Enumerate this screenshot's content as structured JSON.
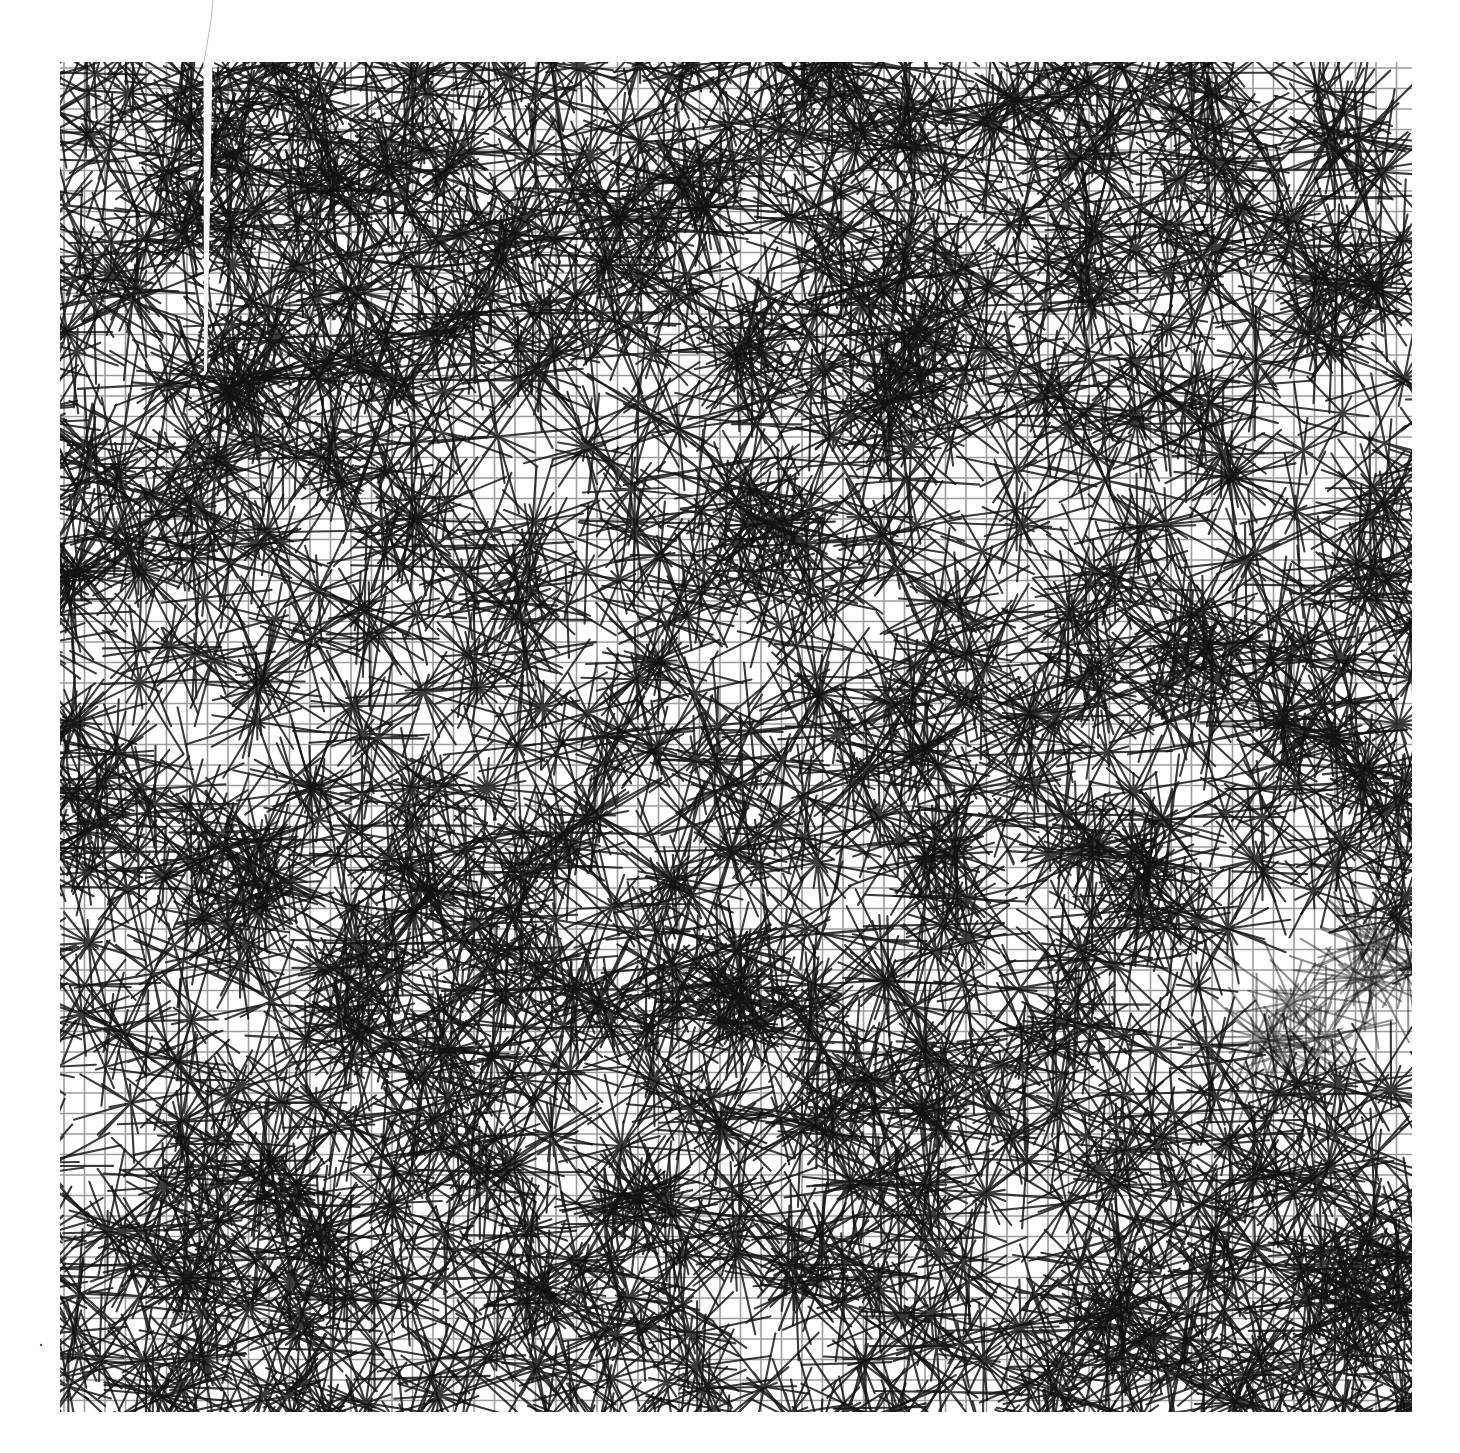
{
  "canvas": {
    "width": 1460,
    "height": 1453,
    "background": "#ffffff"
  },
  "artwork": {
    "description": "Generative plotter-style line pattern: straight segments radiating from scattered hub points over a faint rectangular grid",
    "bounds": {
      "x0": 60,
      "y0": 62,
      "x1": 1412,
      "y1": 1412
    },
    "ink_color": "#111111",
    "grid": {
      "spacing": 20.5,
      "color": "#4a4a4a",
      "alpha": 0.55,
      "line_width": 1.6
    },
    "hubs": {
      "count": 1450,
      "spokes_min": 5,
      "spokes_max": 9,
      "spoke_length_min": 40,
      "spoke_length_max": 85,
      "line_width": 2.1,
      "alpha": 0.82,
      "seed": 90210
    },
    "faded_band": {
      "x0": 1230,
      "y0": 930,
      "x1": 1412,
      "y1": 1080,
      "alpha_scale": 0.55
    },
    "gap": {
      "x": 208,
      "y_top": 62,
      "y_bottom": 372,
      "width_top": 9,
      "width_bottom": 2,
      "color": "#f7f7f7"
    },
    "pencil_mark": {
      "points": [
        [
          213,
          0
        ],
        [
          211,
          20
        ],
        [
          207,
          45
        ],
        [
          204,
          62
        ]
      ],
      "color": "#bdbdbd",
      "line_width": 1
    },
    "speck": {
      "x": 41,
      "y": 1345,
      "r": 1.2,
      "color": "#555555"
    }
  }
}
